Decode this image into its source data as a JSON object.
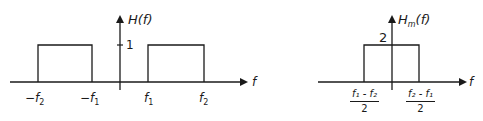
{
  "left_plot": {
    "y_label": "H(f)",
    "x_label": "f",
    "y_tick": "1",
    "x_ticks": [
      "-f2",
      "-f1",
      "f1",
      "f2"
    ],
    "pulses": [
      {
        "from": "-f2",
        "to": "-f1",
        "height": 1
      },
      {
        "from": "f1",
        "to": "f2",
        "height": 1
      }
    ]
  },
  "right_plot": {
    "y_label": "Hm(f)",
    "x_label": "f",
    "y_tick": "2",
    "x_ticks": [
      {
        "numerator": "f1 - f2",
        "denominator": "2"
      },
      {
        "numerator": "f2 - f1",
        "denominator": "2"
      }
    ],
    "pulses": [
      {
        "from": "(f1-f2)/2",
        "to": "(f2-f1)/2",
        "height": 2
      }
    ]
  },
  "labels": {
    "H": "H",
    "Hm_sub": "m",
    "paren_f": "(f)",
    "f": "f",
    "one": "1",
    "two": "2",
    "minus": "−",
    "sub1": "1",
    "sub2": "2",
    "num_left": "f₁ - f₂",
    "num_right": "f₂ - f₁",
    "den": "2"
  }
}
